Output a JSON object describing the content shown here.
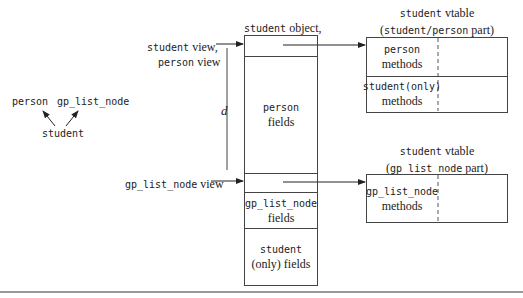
{
  "hierarchy": {
    "parent_left": "person",
    "parent_right": "gp_list_node",
    "child": "student"
  },
  "object": {
    "title_mono": "student",
    "title_serif": " object,",
    "cells": [
      {
        "mono": "",
        "serif": ""
      },
      {
        "mono": "person",
        "serif": "fields"
      },
      {
        "mono": "",
        "serif": ""
      },
      {
        "mono": "gp_list_node",
        "serif": "fields"
      },
      {
        "mono": "student",
        "serif": "(only) fields"
      }
    ]
  },
  "views": {
    "student_view_mono": "student",
    "student_view_serif": " view,",
    "person_view_mono": "person",
    "person_view_serif": " view",
    "gp_view_mono": "gp_list_node",
    "gp_view_serif": " view",
    "distance_label": "d"
  },
  "vtable1": {
    "title_mono": "student",
    "title_serif": " vtable",
    "subtitle_open": "(",
    "subtitle_mono": "student/person",
    "subtitle_serif": " part)",
    "rows": [
      {
        "mono": "person",
        "serif": "methods"
      },
      {
        "mono": "student(only)",
        "serif": "methods"
      }
    ]
  },
  "vtable2": {
    "title_mono": "student",
    "title_serif": " vtable",
    "subtitle_open": "(",
    "subtitle_mono": "gp_list_node",
    "subtitle_serif": " part)",
    "rows": [
      {
        "mono": "gp_list_node",
        "serif": "methods"
      }
    ]
  }
}
